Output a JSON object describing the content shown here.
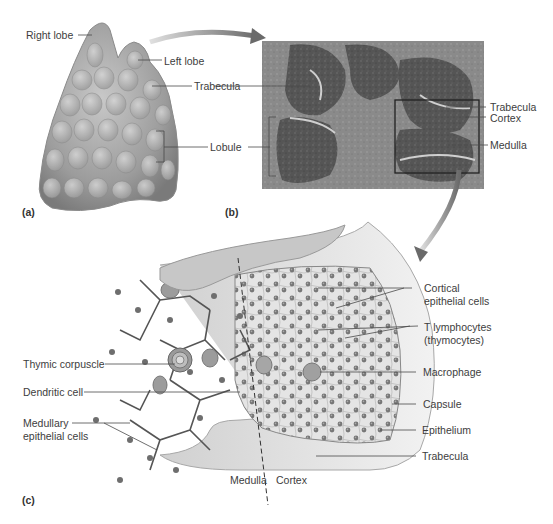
{
  "figure": {
    "colors": {
      "organ": "#9a9a9a",
      "organ_light": "#c4c4c4",
      "micrograph_dark": "#4a4a4a",
      "micrograph_medium": "#7c7c7c",
      "arrow": "#8a8a8a",
      "capsule": "#b5b5b5",
      "cell_nucleus": "#6a6a6a",
      "label_text": "#3d3d3d",
      "leader_line": "#4a4a4a"
    }
  },
  "panel_a": {
    "tag": "(a)",
    "labels": {
      "right_lobe": "Right lobe",
      "left_lobe": "Left lobe",
      "trabecula": "Trabecula",
      "lobule": "Lobule"
    }
  },
  "panel_b": {
    "tag": "(b)",
    "labels": {
      "trabecula": "Trabecula",
      "cortex": "Cortex",
      "medulla": "Medulla"
    }
  },
  "panel_c": {
    "tag": "(c)",
    "labels_right": {
      "cortical_epithelial_line1": "Cortical",
      "cortical_epithelial_line2": "epithelial cells",
      "t_lymphocytes_line1": "T lymphocytes",
      "t_lymphocytes_line2": "(thymocytes)",
      "macrophage": "Macrophage",
      "capsule": "Capsule",
      "epithelium": "Epithelium",
      "trabecula": "Trabecula"
    },
    "labels_left": {
      "thymic_corpuscle": "Thymic corpuscle",
      "dendritic_cell": "Dendritic cell",
      "medullary_epithelial_line1": "Medullary",
      "medullary_epithelial_line2": "epithelial cells"
    },
    "labels_bottom": {
      "medulla": "Medulla",
      "cortex": "Cortex"
    }
  }
}
